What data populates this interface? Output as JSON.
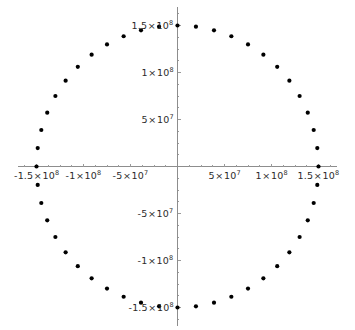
{
  "chart_data": {
    "type": "scatter",
    "title": "",
    "subtitle": "",
    "xlabel": "",
    "ylabel": "",
    "grid": false,
    "legend": null,
    "axes_origin_crossing": true,
    "xlim": [
      -170000000,
      170000000
    ],
    "ylim": [
      -170000000,
      170000000
    ],
    "radius": 150000000,
    "n_points": 48,
    "x_tick_values": [
      -150000000,
      -100000000,
      -50000000,
      50000000,
      100000000,
      150000000
    ],
    "y_tick_values": [
      -150000000,
      -100000000,
      -50000000,
      50000000,
      100000000,
      150000000
    ],
    "x_tick_labels": [
      {
        "mantissa": "-1.5",
        "times": "×",
        "base": "10",
        "exp": "8",
        "value": -150000000
      },
      {
        "mantissa": "-1",
        "times": "×",
        "base": "10",
        "exp": "8",
        "value": -100000000
      },
      {
        "mantissa": "-5",
        "times": "×",
        "base": "10",
        "exp": "7",
        "value": -50000000
      },
      {
        "mantissa": "5",
        "times": "×",
        "base": "10",
        "exp": "7",
        "value": 50000000
      },
      {
        "mantissa": "1",
        "times": "×",
        "base": "10",
        "exp": "8",
        "value": 100000000
      },
      {
        "mantissa": "1.5",
        "times": "×",
        "base": "10",
        "exp": "8",
        "value": 150000000
      }
    ],
    "y_tick_labels": [
      {
        "mantissa": "1.5",
        "times": "×",
        "base": "10",
        "exp": "8",
        "value": 150000000
      },
      {
        "mantissa": "1",
        "times": "×",
        "base": "10",
        "exp": "8",
        "value": 100000000
      },
      {
        "mantissa": "5",
        "times": "×",
        "base": "10",
        "exp": "7",
        "value": 50000000
      },
      {
        "mantissa": "-5",
        "times": "×",
        "base": "10",
        "exp": "7",
        "value": -50000000
      },
      {
        "mantissa": "-1",
        "times": "×",
        "base": "10",
        "exp": "8",
        "value": -100000000
      },
      {
        "mantissa": "-1.5",
        "times": "×",
        "base": "10",
        "exp": "8",
        "value": -150000000
      }
    ],
    "points": [
      {
        "x": 150000000.0,
        "y": 0.0
      },
      {
        "x": 148713670.4,
        "y": 19603428.1
      },
      {
        "x": 144888873.9,
        "y": 38822856.5
      },
      {
        "x": 138581929.9,
        "y": 57291666.8
      },
      {
        "x": 129903810.6,
        "y": 75000000.0
      },
      {
        "x": 119008467.8,
        "y": 91354545.8
      },
      {
        "x": 106066017.2,
        "y": 106066017.2
      },
      {
        "x": 91354545.8,
        "y": 119008467.8
      },
      {
        "x": 75000000.0,
        "y": 129903810.6
      },
      {
        "x": 57291666.8,
        "y": 138581929.9
      },
      {
        "x": 38822856.5,
        "y": 144888873.9
      },
      {
        "x": 19603428.1,
        "y": 148713670.4
      },
      {
        "x": 0.0,
        "y": 150000000.0
      },
      {
        "x": -19603428.1,
        "y": 148713670.4
      },
      {
        "x": -38822856.5,
        "y": 144888873.9
      },
      {
        "x": -57291666.8,
        "y": 138581929.9
      },
      {
        "x": -75000000.0,
        "y": 129903810.6
      },
      {
        "x": -91354545.8,
        "y": 119008467.8
      },
      {
        "x": -106066017.2,
        "y": 106066017.2
      },
      {
        "x": -119008467.8,
        "y": 91354545.8
      },
      {
        "x": -129903810.6,
        "y": 75000000.0
      },
      {
        "x": -138581929.9,
        "y": 57291666.8
      },
      {
        "x": -144888873.9,
        "y": 38822856.5
      },
      {
        "x": -148713670.4,
        "y": 19603428.1
      },
      {
        "x": -150000000.0,
        "y": 0.0
      },
      {
        "x": -148713670.4,
        "y": -19603428.1
      },
      {
        "x": -144888873.9,
        "y": -38822856.5
      },
      {
        "x": -138581929.9,
        "y": -57291666.8
      },
      {
        "x": -129903810.6,
        "y": -75000000.0
      },
      {
        "x": -119008467.8,
        "y": -91354545.8
      },
      {
        "x": -106066017.2,
        "y": -106066017.2
      },
      {
        "x": -91354545.8,
        "y": -119008467.8
      },
      {
        "x": -75000000.0,
        "y": -129903810.6
      },
      {
        "x": -57291666.8,
        "y": -138581929.9
      },
      {
        "x": -38822856.5,
        "y": -144888873.9
      },
      {
        "x": -19603428.1,
        "y": -148713670.4
      },
      {
        "x": 0.0,
        "y": -150000000.0
      },
      {
        "x": 19603428.1,
        "y": -148713670.4
      },
      {
        "x": 38822856.5,
        "y": -144888873.9
      },
      {
        "x": 57291666.8,
        "y": -138581929.9
      },
      {
        "x": 75000000.0,
        "y": -129903810.6
      },
      {
        "x": 91354545.8,
        "y": -119008467.8
      },
      {
        "x": 106066017.2,
        "y": -106066017.2
      },
      {
        "x": 119008467.8,
        "y": -91354545.8
      },
      {
        "x": 129903810.6,
        "y": -75000000.0
      },
      {
        "x": 138581929.9,
        "y": -57291666.8
      },
      {
        "x": 144888873.9,
        "y": -38822856.5
      },
      {
        "x": 148713670.4,
        "y": -19603428.1
      }
    ]
  },
  "style": {
    "point_color": "#000000",
    "point_radius_px": 2.1,
    "axis_color": "#8d8d8d",
    "label_color": "#2b2b2b",
    "background": "#ffffff"
  },
  "geometry": {
    "origin_x_px": 177.5,
    "origin_y_px": 166.5,
    "scale_px_per_unit": 9.4e-07
  }
}
